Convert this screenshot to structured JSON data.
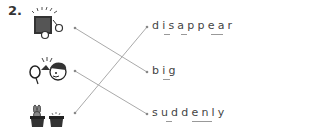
{
  "question": {
    "number": "2.",
    "pictures": [
      {
        "name": "box-with-sparkles-picture",
        "description": "box appearing with sparkles"
      },
      {
        "name": "boy-shouting-picture",
        "description": "boy with balloon / surprise"
      },
      {
        "name": "magic-hats-picture",
        "description": "rabbit in hat and empty hat"
      }
    ],
    "words": [
      {
        "label": "disappear"
      },
      {
        "label": "big"
      },
      {
        "label": "suddenly"
      }
    ],
    "matches": [
      {
        "from": 0,
        "to": 1
      },
      {
        "from": 1,
        "to": 2
      },
      {
        "from": 2,
        "to": 0
      }
    ],
    "line_color": "#aaaaaa",
    "dot_color": "#888888"
  }
}
